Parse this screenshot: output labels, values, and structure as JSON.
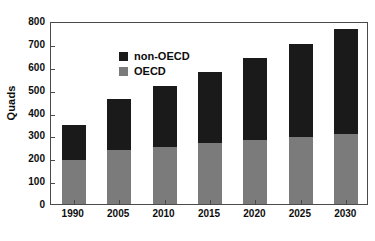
{
  "chart_data": {
    "type": "bar",
    "stacked": true,
    "title": "",
    "xlabel": "",
    "ylabel": "Quads",
    "ylim": [
      0,
      800
    ],
    "yticks": [
      0,
      100,
      200,
      300,
      400,
      500,
      600,
      700,
      800
    ],
    "ytick_labels": [
      "0",
      "100",
      "200",
      "300",
      "400",
      "500",
      "600",
      "700",
      "800"
    ],
    "grid": false,
    "legend_position": "upper-left-inside",
    "categories": [
      "1990",
      "2005",
      "2010",
      "2015",
      "2020",
      "2025",
      "2030"
    ],
    "series": [
      {
        "name": "non-OECD",
        "color": "#1a1a1a",
        "values": [
          153,
          225,
          265,
          313,
          358,
          408,
          458
        ]
      },
      {
        "name": "OECD",
        "color": "#7b7b7b",
        "values": [
          192,
          235,
          250,
          265,
          280,
          292,
          305
        ]
      }
    ],
    "stack_order": [
      "OECD",
      "non-OECD"
    ],
    "totals": [
      345,
      460,
      515,
      578,
      638,
      700,
      763
    ]
  },
  "colors": {
    "non_oecd": "#1a1a1a",
    "oecd": "#7b7b7b",
    "axis": "#4a4a4a",
    "text": "#0d0d0d",
    "background": "#ffffff"
  }
}
